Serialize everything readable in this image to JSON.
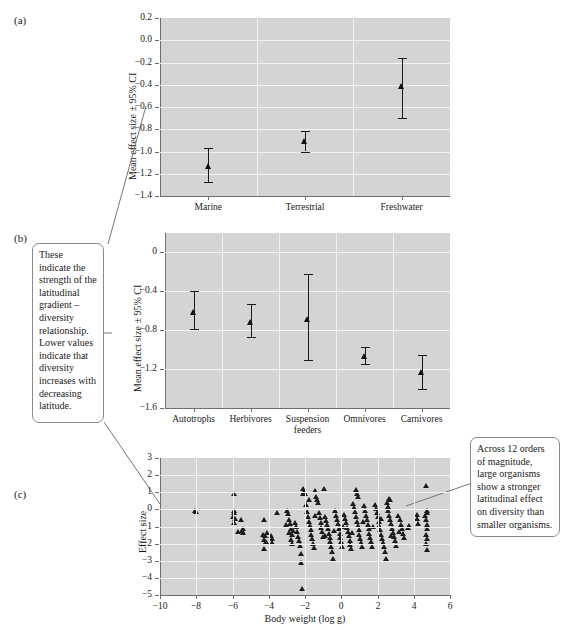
{
  "figure": {
    "panels": [
      {
        "id": "a",
        "label": "(a)"
      },
      {
        "id": "b",
        "label": "(b)"
      },
      {
        "id": "c",
        "label": "(c)"
      }
    ]
  },
  "annotations": [
    {
      "name": "callout-effect-size",
      "text": "These indicate the strength of the latitudinal gradient – diversity relationship. Lower values indicate that diversity increases with decreasing latitude."
    },
    {
      "name": "callout-body-weight",
      "text": "Across 12 orders of magnitude, large organisms show a stronger latitudinal effect on diversity than smaller organisms."
    }
  ],
  "chart_data": [
    {
      "panel": "a",
      "type": "scatter",
      "title": "",
      "xlabel": "",
      "ylabel": "Mean effect size ± 95% CI",
      "categories": [
        "Marine",
        "Terrestrial",
        "Freshwater"
      ],
      "values": [
        -1.13,
        -0.91,
        -0.41
      ],
      "ci_lower": [
        -1.27,
        -1.0,
        -0.7
      ],
      "ci_upper": [
        -0.97,
        -0.82,
        -0.16
      ],
      "ylim": [
        -1.4,
        0.2
      ],
      "yticks": [
        0.2,
        0.0,
        -0.2,
        -0.4,
        -0.6,
        -0.8,
        -1.0,
        -1.2,
        -1.4
      ],
      "yticklabels": [
        "0.2",
        "0.0",
        "−0.2",
        "−0.4",
        "−0.6",
        "−0.8",
        "−1.0",
        "−1.2",
        "−1.4"
      ],
      "grid": true,
      "legend": "none"
    },
    {
      "panel": "b",
      "type": "scatter",
      "title": "",
      "xlabel": "",
      "ylabel": "Mean effect size ± 95% CI",
      "categories": [
        "Autotrophs",
        "Herbivores",
        "Suspension feeders",
        "Omnivores",
        "Carnivores"
      ],
      "values": [
        -0.61,
        -0.72,
        -0.68,
        -1.06,
        -1.23
      ],
      "ci_lower": [
        -0.79,
        -0.87,
        -1.11,
        -1.15,
        -1.4
      ],
      "ci_upper": [
        -0.4,
        -0.53,
        -0.22,
        -0.97,
        -1.05
      ],
      "ylim": [
        -1.6,
        0.2
      ],
      "yticks": [
        0,
        -0.4,
        -0.8,
        -1.2,
        -1.6
      ],
      "yticklabels": [
        "0",
        "−0.4",
        "−0.8",
        "−1.2",
        "−1.6"
      ],
      "grid": true,
      "legend": "none"
    },
    {
      "panel": "c",
      "type": "scatter",
      "title": "",
      "xlabel": "Body weight (log g)",
      "ylabel": "Effect size",
      "xlim": [
        -10,
        6
      ],
      "ylim": [
        -5,
        3
      ],
      "xticks": [
        -10,
        -8,
        -6,
        -4,
        -2,
        0,
        2,
        4,
        6
      ],
      "xticklabels": [
        "−10",
        "−8",
        "−6",
        "−4",
        "−2",
        "0",
        "2",
        "4",
        "6"
      ],
      "yticks": [
        3,
        2,
        1,
        0,
        -1,
        -2,
        -3,
        -4,
        -5
      ],
      "yticklabels": [
        "3",
        "2",
        "1",
        "0",
        "−1",
        "−2",
        "−3",
        "−4",
        "−5"
      ],
      "grid": true,
      "legend": "none",
      "points": [
        [
          -8.15,
          -0.08
        ],
        [
          -8.05,
          -0.14
        ],
        [
          -6.0,
          0.9
        ],
        [
          -5.95,
          -0.05
        ],
        [
          -6.05,
          -0.4
        ],
        [
          -5.9,
          -0.55
        ],
        [
          -5.95,
          -0.75
        ],
        [
          -5.6,
          -0.6
        ],
        [
          -5.55,
          -1.25
        ],
        [
          -5.5,
          -1.35
        ],
        [
          -4.3,
          -0.6
        ],
        [
          -4.35,
          -1.45
        ],
        [
          -4.25,
          -1.55
        ],
        [
          -4.3,
          -1.75
        ],
        [
          -4.2,
          -1.9
        ],
        [
          -4.3,
          -2.3
        ],
        [
          -3.9,
          -1.7
        ],
        [
          -3.85,
          -1.95
        ],
        [
          -3.6,
          -0.2
        ],
        [
          -3.05,
          -0.05
        ],
        [
          -3.0,
          -0.25
        ],
        [
          -2.95,
          -0.6
        ],
        [
          -2.9,
          -0.85
        ],
        [
          -2.85,
          -1.1
        ],
        [
          -2.95,
          -1.35
        ],
        [
          -2.8,
          -1.5
        ],
        [
          -2.85,
          -1.75
        ],
        [
          -2.75,
          -2.0
        ],
        [
          -2.6,
          -0.75
        ],
        [
          -2.55,
          -1.0
        ],
        [
          -2.5,
          -1.3
        ],
        [
          -2.45,
          -1.6
        ],
        [
          -2.4,
          -1.85
        ],
        [
          -2.35,
          -2.1
        ],
        [
          -2.3,
          -2.6
        ],
        [
          -2.25,
          -3.1
        ],
        [
          -2.2,
          -4.6
        ],
        [
          -2.15,
          1.2
        ],
        [
          -2.1,
          1.05
        ],
        [
          -2.05,
          0.9
        ],
        [
          -2.0,
          0.3
        ],
        [
          -1.95,
          -0.15
        ],
        [
          -1.9,
          -0.45
        ],
        [
          -1.85,
          -0.7
        ],
        [
          -1.8,
          -0.95
        ],
        [
          -1.75,
          -1.2
        ],
        [
          -1.7,
          -1.45
        ],
        [
          -1.65,
          -1.7
        ],
        [
          -1.6,
          -2.0
        ],
        [
          -1.55,
          -2.25
        ],
        [
          -1.5,
          1.1
        ],
        [
          -1.45,
          0.75
        ],
        [
          -1.4,
          0.55
        ],
        [
          -1.35,
          0.4
        ],
        [
          -1.3,
          -0.2
        ],
        [
          -1.25,
          -0.5
        ],
        [
          -1.2,
          -0.8
        ],
        [
          -1.15,
          -1.05
        ],
        [
          -1.1,
          -1.3
        ],
        [
          -1.05,
          -1.6
        ],
        [
          -1.0,
          1.2
        ],
        [
          -0.95,
          -0.4
        ],
        [
          -0.9,
          -0.65
        ],
        [
          -0.85,
          -0.9
        ],
        [
          -0.8,
          -1.15
        ],
        [
          -0.75,
          -1.4
        ],
        [
          -0.7,
          -1.65
        ],
        [
          -0.65,
          -1.9
        ],
        [
          -0.6,
          -2.15
        ],
        [
          -0.55,
          -2.45
        ],
        [
          -0.5,
          -2.85
        ],
        [
          -0.4,
          -0.05
        ],
        [
          -0.35,
          -0.35
        ],
        [
          -0.3,
          -0.6
        ],
        [
          -0.25,
          -0.85
        ],
        [
          -0.2,
          -1.1
        ],
        [
          -0.15,
          -1.4
        ],
        [
          -0.1,
          -1.65
        ],
        [
          -0.05,
          -1.9
        ],
        [
          0.0,
          -2.15
        ],
        [
          0.1,
          -0.3
        ],
        [
          0.15,
          -0.55
        ],
        [
          0.2,
          -0.8
        ],
        [
          0.25,
          -1.05
        ],
        [
          0.3,
          -1.3
        ],
        [
          0.35,
          -1.55
        ],
        [
          0.4,
          -1.8
        ],
        [
          0.45,
          -2.05
        ],
        [
          0.5,
          -2.3
        ],
        [
          0.6,
          0.35
        ],
        [
          0.65,
          0.1
        ],
        [
          0.7,
          -0.15
        ],
        [
          0.75,
          -0.45
        ],
        [
          0.8,
          -0.7
        ],
        [
          0.85,
          -0.95
        ],
        [
          0.9,
          -1.2
        ],
        [
          0.95,
          -1.45
        ],
        [
          1.0,
          -1.7
        ],
        [
          1.05,
          -1.95
        ],
        [
          1.1,
          -2.2
        ],
        [
          0.75,
          1.15
        ],
        [
          0.8,
          0.95
        ],
        [
          0.85,
          0.75
        ],
        [
          1.2,
          0.2
        ],
        [
          1.25,
          -0.1
        ],
        [
          1.3,
          -0.35
        ],
        [
          1.35,
          -0.6
        ],
        [
          1.4,
          -0.9
        ],
        [
          1.45,
          -1.15
        ],
        [
          1.5,
          -1.4
        ],
        [
          1.55,
          -1.65
        ],
        [
          1.6,
          -1.9
        ],
        [
          1.65,
          -2.15
        ],
        [
          1.8,
          0.3
        ],
        [
          1.85,
          0.05
        ],
        [
          1.9,
          -0.2
        ],
        [
          1.95,
          -0.45
        ],
        [
          2.0,
          -0.7
        ],
        [
          2.05,
          -0.95
        ],
        [
          2.1,
          -1.2
        ],
        [
          2.15,
          -1.45
        ],
        [
          2.2,
          -1.7
        ],
        [
          2.25,
          -1.95
        ],
        [
          2.3,
          -2.2
        ],
        [
          2.35,
          -2.45
        ],
        [
          2.4,
          -2.85
        ],
        [
          2.45,
          0.4
        ],
        [
          2.5,
          0.15
        ],
        [
          2.55,
          -0.1
        ],
        [
          2.6,
          -0.35
        ],
        [
          2.65,
          -0.6
        ],
        [
          2.7,
          -0.85
        ],
        [
          2.75,
          -1.1
        ],
        [
          2.8,
          -1.35
        ],
        [
          2.85,
          -1.6
        ],
        [
          2.9,
          -1.85
        ],
        [
          2.95,
          -2.1
        ],
        [
          2.6,
          0.65
        ],
        [
          2.65,
          0.55
        ],
        [
          3.1,
          -0.35
        ],
        [
          3.2,
          -0.6
        ],
        [
          3.25,
          -0.9
        ],
        [
          3.3,
          -1.15
        ],
        [
          3.35,
          -1.4
        ],
        [
          3.4,
          -1.65
        ],
        [
          3.6,
          -1.05
        ],
        [
          3.7,
          -0.95
        ],
        [
          4.1,
          -0.3
        ],
        [
          4.15,
          -0.55
        ],
        [
          4.2,
          -0.85
        ],
        [
          4.6,
          1.4
        ],
        [
          4.65,
          -0.05
        ],
        [
          4.7,
          -0.2
        ],
        [
          4.6,
          -0.6
        ],
        [
          4.65,
          -0.9
        ],
        [
          4.7,
          -1.15
        ],
        [
          4.6,
          -1.45
        ],
        [
          4.65,
          -1.7
        ],
        [
          4.6,
          -2.0
        ],
        [
          4.65,
          -2.35
        ],
        [
          -5.75,
          -1.3
        ],
        [
          -4.15,
          -1.35
        ],
        [
          -3.95,
          -1.55
        ],
        [
          -3.1,
          -0.9
        ],
        [
          -2.7,
          -1.25
        ],
        [
          -2.15,
          0.95
        ],
        [
          -1.85,
          0.6
        ],
        [
          -1.5,
          -0.35
        ],
        [
          -0.95,
          -1.55
        ],
        [
          -0.45,
          -1.25
        ],
        [
          0.05,
          -1.0
        ],
        [
          0.55,
          -1.35
        ],
        [
          1.15,
          -0.7
        ],
        [
          1.7,
          -1.0
        ],
        [
          2.15,
          -0.55
        ],
        [
          2.7,
          -1.55
        ],
        [
          3.15,
          -1.3
        ],
        [
          4.55,
          -0.35
        ],
        [
          -6.0,
          -0.2
        ],
        [
          -5.5,
          -1.1
        ]
      ]
    }
  ]
}
